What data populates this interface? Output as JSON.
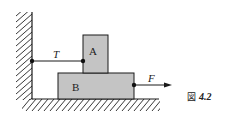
{
  "figure": {
    "caption_prefix": "図",
    "caption_number": "4.2"
  },
  "blocks": {
    "upper": {
      "label": "A"
    },
    "lower": {
      "label": "B"
    }
  },
  "forces": {
    "tension": {
      "label": "T"
    },
    "applied": {
      "label": "F"
    }
  },
  "colors": {
    "block_fill": "#c4c4c4",
    "stroke": "#1a1a1a"
  }
}
